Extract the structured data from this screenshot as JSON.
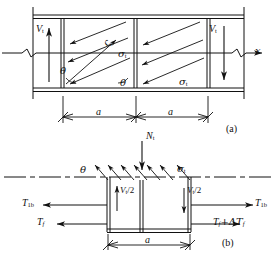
{
  "figure": {
    "caption_a": "(a)",
    "caption_b": "(b)"
  },
  "diagram_a": {
    "name": "tension-field-web-panel",
    "axis_label": "x",
    "shear_left": "V",
    "shear_left_sub": "t",
    "shear_right": "V",
    "shear_right_sub": "t",
    "angle_label_1": "θ",
    "angle_label_2": "θ",
    "stress_label_1": "σ",
    "stress_label_1_sub": "t",
    "stress_label_2": "σ",
    "stress_label_2_sub": "t",
    "stress_label_3": "ς",
    "dim_1": "a",
    "dim_2": "a"
  },
  "diagram_b": {
    "name": "free-body-panel",
    "normal_force": "N",
    "normal_force_sub": "t",
    "stress_label": "σ",
    "stress_label_sub": "t",
    "angle_label": "θ",
    "shear_half_left": "V",
    "shear_half_left_sub": "t",
    "shear_half_left_div": "/2",
    "shear_half_right": "V",
    "shear_half_right_sub": "t",
    "shear_half_right_div": "/2",
    "flange_force_left_top": "T",
    "flange_force_left_top_sub": "1b",
    "flange_force_right_top": "T",
    "flange_force_right_top_sub": "1b",
    "flange_force_left_bot": "T",
    "flange_force_left_bot_sub": "f",
    "flange_force_right_bot": "T",
    "flange_force_right_bot_sub": "f",
    "flange_force_right_bot_delta": "+ΔT",
    "flange_force_right_bot_delta_sub": "f",
    "dim": "a"
  },
  "colors": {
    "stroke": "#111111",
    "background": "#ffffff"
  }
}
